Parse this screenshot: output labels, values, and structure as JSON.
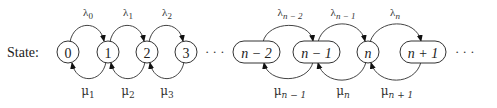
{
  "diagram": {
    "type": "birth-death process state-transition diagram",
    "row_label": "State:",
    "ellipsis": "· · ·",
    "states": [
      {
        "id": "0",
        "label": "0",
        "shape": "circle"
      },
      {
        "id": "1",
        "label": "1",
        "shape": "circle"
      },
      {
        "id": "2",
        "label": "2",
        "shape": "circle"
      },
      {
        "id": "3",
        "label": "3",
        "shape": "circle"
      },
      {
        "id": "n-2",
        "label": "n − 2",
        "shape": "pill"
      },
      {
        "id": "n-1",
        "label": "n − 1",
        "shape": "pill"
      },
      {
        "id": "n",
        "label": "n",
        "shape": "circle"
      },
      {
        "id": "n+1",
        "label": "n + 1",
        "shape": "pill"
      }
    ],
    "forward_transitions": [
      {
        "from": "0",
        "to": "1",
        "rate": "λ0"
      },
      {
        "from": "1",
        "to": "2",
        "rate": "λ1"
      },
      {
        "from": "2",
        "to": "3",
        "rate": "λ2"
      },
      {
        "from": "n-2",
        "to": "n-1",
        "rate": "λn − 2"
      },
      {
        "from": "n-1",
        "to": "n",
        "rate": "λn − 1"
      },
      {
        "from": "n",
        "to": "n+1",
        "rate": "λn"
      }
    ],
    "backward_transitions": [
      {
        "from": "1",
        "to": "0",
        "rate": "μ1"
      },
      {
        "from": "2",
        "to": "1",
        "rate": "μ2"
      },
      {
        "from": "3",
        "to": "2",
        "rate": "μ3"
      },
      {
        "from": "n-1",
        "to": "n-2",
        "rate": "μn − 1"
      },
      {
        "from": "n",
        "to": "n-1",
        "rate": "μn"
      },
      {
        "from": "n+1",
        "to": "n",
        "rate": "μn + 1"
      }
    ],
    "lambda_labels": [
      {
        "sym": "λ",
        "sub": "0"
      },
      {
        "sym": "λ",
        "sub": "1"
      },
      {
        "sym": "λ",
        "sub": "2"
      },
      {
        "sym": "λ",
        "sub": "n − 2"
      },
      {
        "sym": "λ",
        "sub": "n − 1"
      },
      {
        "sym": "λ",
        "sub": "n"
      }
    ],
    "mu_labels": [
      {
        "sym": "μ",
        "sub": "1"
      },
      {
        "sym": "μ",
        "sub": "2"
      },
      {
        "sym": "μ",
        "sub": "3"
      },
      {
        "sym": "μ",
        "sub": "n − 1"
      },
      {
        "sym": "μ",
        "sub": "n"
      },
      {
        "sym": "μ",
        "sub": "n + 1"
      }
    ]
  }
}
